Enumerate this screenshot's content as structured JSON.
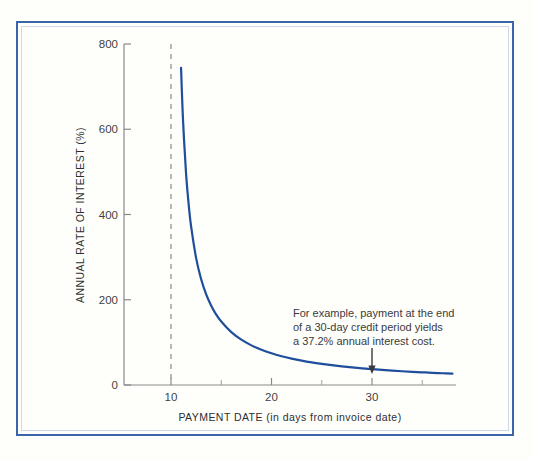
{
  "figure": {
    "background_color": "#fefefb",
    "frame_color": "#3c64a8",
    "inner_frame_color": "#cdd8ea"
  },
  "chart_data": {
    "type": "line",
    "title": "",
    "xlabel": "PAYMENT DATE (in days from invoice date)",
    "ylabel": "ANNUAL RATE OF INTEREST (%)",
    "xlim": [
      6,
      38.5
    ],
    "ylim": [
      0,
      800
    ],
    "grid": false,
    "legend": "none",
    "x_major_ticks": [
      10,
      20,
      30
    ],
    "x_major_tick_labels": [
      "10",
      "20",
      "30"
    ],
    "x_minor_ticks": [
      15,
      25,
      35
    ],
    "y_major_ticks": [
      0,
      200,
      400,
      600,
      800
    ],
    "y_major_tick_labels": [
      "0",
      "200",
      "400",
      "600",
      "800"
    ],
    "series": [
      {
        "name": "Annual rate of interest",
        "color": "#1f4e9c",
        "line_width": 2.2,
        "x": [
          11.0,
          11.2,
          11.5,
          11.8,
          12.0,
          12.5,
          13.0,
          13.5,
          14.0,
          14.5,
          15.0,
          16.0,
          17.0,
          18.0,
          19.0,
          20.0,
          21.0,
          22.0,
          23.0,
          24.0,
          25.0,
          26.0,
          27.0,
          28.0,
          29.0,
          30.0,
          31.0,
          32.0,
          33.0,
          34.0,
          35.0,
          36.0,
          37.0,
          38.0
        ],
        "y": [
          744.0,
          620.0,
          496.0,
          413.3,
          372.0,
          297.6,
          248.0,
          212.6,
          186.0,
          165.3,
          148.8,
          124.0,
          106.3,
          93.0,
          82.7,
          74.4,
          67.6,
          62.0,
          57.2,
          53.1,
          49.6,
          46.5,
          43.8,
          41.3,
          39.2,
          37.2,
          35.4,
          33.8,
          32.3,
          31.0,
          29.8,
          28.6,
          27.6,
          26.6
        ]
      }
    ],
    "reference_lines": [
      {
        "name": "discount-period-line",
        "orientation": "vertical",
        "x": 10,
        "style": "dashed",
        "color": "#9a9a9a"
      }
    ],
    "annotations": [
      {
        "name": "example-callout",
        "lines": [
          "For example, payment at the end",
          "of a 30-day credit period yields",
          "a 37.2% annual interest cost."
        ],
        "arrow_points_to_x": 30,
        "arrow_points_to_y": 37.2
      }
    ]
  }
}
